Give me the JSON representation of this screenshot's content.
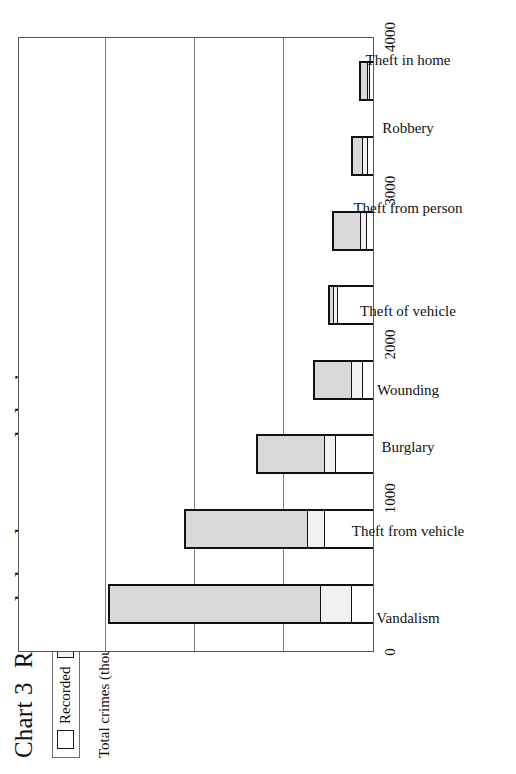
{
  "title": {
    "number": "Chart 3",
    "text": "Recorded and unrecorded crime"
  },
  "axis_title": "Total crimes (thousands)",
  "legend": {
    "items": [
      {
        "label": "Recorded",
        "color": "#ffffff"
      },
      {
        "label": "Reported but unrecorded",
        "color": "#f1f1f1"
      },
      {
        "label": "Unreported",
        "color": "#d9d9d9"
      }
    ]
  },
  "chart_data": {
    "type": "bar",
    "stacked": true,
    "orientation": "vertical",
    "xlabel": "",
    "ylabel": "Total crimes (thousands)",
    "ylim": [
      0,
      4000
    ],
    "yticks": [
      0,
      1000,
      2000,
      3000,
      4000
    ],
    "ytick_labels": [
      "0",
      "1000",
      "2000",
      "3000",
      "4000"
    ],
    "grid": true,
    "legend_position": "top-left",
    "categories": [
      "Vandalism",
      "Theft from vehicle",
      "Burglary",
      "Wounding",
      "Theft of vehicle",
      "Theft from person",
      "Robbery",
      "Theft in home"
    ],
    "series": [
      {
        "name": "Recorded",
        "color": "#ffffff",
        "values": [
          250,
          550,
          430,
          120,
          410,
          80,
          70,
          40
        ]
      },
      {
        "name": "Reported but unrecorded",
        "color": "#f1f1f1",
        "values": [
          350,
          190,
          120,
          130,
          35,
          70,
          50,
          30
        ]
      },
      {
        "name": "Unreported",
        "color": "#d9d9d9",
        "values": [
          2360,
          1360,
          740,
          400,
          35,
          290,
          100,
          70
        ]
      }
    ],
    "totals": [
      2960,
      2100,
      1290,
      650,
      480,
      440,
      220,
      140
    ]
  }
}
